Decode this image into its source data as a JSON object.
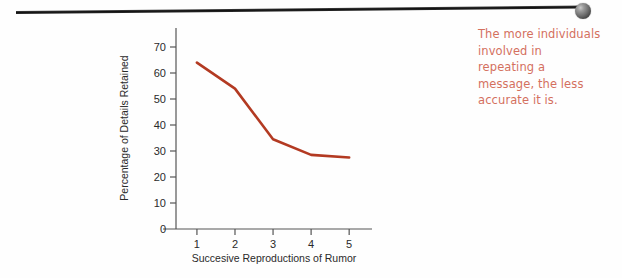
{
  "annotation": {
    "name": "callout-note",
    "color": "#d4705e",
    "lines": [
      "The more individuals",
      "involved in",
      "repeating a",
      "message, the less",
      "accurate it is."
    ]
  },
  "pointer": {
    "rule_color": "#111111",
    "sphere_color": "#6d6d6d",
    "sphere_icon": "sphere-pin-head-icon"
  },
  "chart_data": {
    "type": "line",
    "title": "",
    "subtitle": "",
    "xlabel": "Succesive Reproductions of Rumor",
    "ylabel": "Percentage of Details Retained",
    "x": [
      1,
      2,
      3,
      4,
      5
    ],
    "values": [
      64,
      54,
      34.5,
      28.5,
      27.5
    ],
    "series": [
      {
        "name": "Details retained",
        "color": "#b33a22",
        "values": [
          64,
          54,
          34.5,
          28.5,
          27.5
        ]
      }
    ],
    "xtick_labels": [
      "1",
      "2",
      "3",
      "4",
      "5"
    ],
    "ytick_labels": [
      "0",
      "10",
      "20",
      "30",
      "40",
      "50",
      "60",
      "70"
    ],
    "ytick_values": [
      0,
      10,
      20,
      30,
      40,
      50,
      60,
      70
    ],
    "xlim": [
      0.45,
      5.6
    ],
    "ylim": [
      0,
      75
    ],
    "grid": false,
    "legend": false,
    "legend_position": "none",
    "line_color": "#b33a22",
    "axis_color": "#555555"
  }
}
